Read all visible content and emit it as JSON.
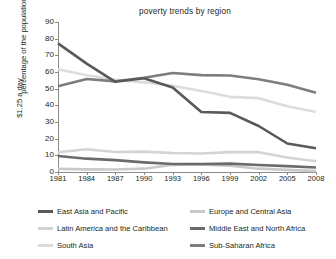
{
  "chart_data": {
    "type": "line",
    "title": "poverty trends by region",
    "xlabel": "",
    "ylabel": "percentage of the population living below $1.25 a day",
    "ylabel_line1": "percentage of the population living below",
    "ylabel_line2": "$1.25 a day",
    "x": [
      1981,
      1984,
      1987,
      1990,
      1993,
      1996,
      1999,
      2002,
      2005,
      2008
    ],
    "xticks": [
      "1981",
      "1984",
      "1987",
      "1990",
      "1993",
      "1996",
      "1999",
      "2002",
      "2005",
      "2008"
    ],
    "yticks": [
      "0",
      "10",
      "20",
      "30",
      "40",
      "50",
      "60",
      "70",
      "80",
      "90"
    ],
    "xlim": [
      1981,
      2008
    ],
    "ylim": [
      0,
      90
    ],
    "grid": false,
    "legend_position": "bottom",
    "series": [
      {
        "name": "East Asia and Pacific",
        "color": "#595959",
        "values": [
          77.2,
          65.0,
          54.1,
          56.2,
          50.7,
          36.0,
          35.5,
          27.6,
          17.1,
          14.3
        ]
      },
      {
        "name": "Europe and Central Asia",
        "color": "#c9c9c9",
        "values": [
          1.9,
          1.6,
          1.5,
          2.0,
          4.3,
          4.6,
          3.8,
          2.0,
          1.3,
          0.5
        ]
      },
      {
        "name": "Latin America and the Caribbean",
        "color": "#d4d4d4",
        "values": [
          11.9,
          13.6,
          12.0,
          12.2,
          11.4,
          11.1,
          11.9,
          11.9,
          8.7,
          6.5
        ]
      },
      {
        "name": "Middle East and North Africa",
        "color": "#6b6b6b",
        "values": [
          9.6,
          8.0,
          7.1,
          5.8,
          4.8,
          4.8,
          5.0,
          4.2,
          3.5,
          2.7
        ]
      },
      {
        "name": "South Asia",
        "color": "#dcdcdc",
        "values": [
          61.6,
          58.0,
          55.3,
          53.8,
          51.7,
          48.6,
          45.1,
          44.3,
          39.4,
          36.0
        ]
      },
      {
        "name": "Sub-Saharan Africa",
        "color": "#7d7d7d",
        "values": [
          51.5,
          55.8,
          54.4,
          56.5,
          59.4,
          58.1,
          57.9,
          55.7,
          52.3,
          47.5
        ]
      }
    ]
  },
  "legend": {
    "items": [
      {
        "label": "East Asia and Pacific",
        "color": "#595959"
      },
      {
        "label": "Europe and Central Asia",
        "color": "#c9c9c9"
      },
      {
        "label": "Latin America and the Caribbean",
        "color": "#d4d4d4"
      },
      {
        "label": "Middle East and North Africa",
        "color": "#6b6b6b"
      },
      {
        "label": "South Asia",
        "color": "#dcdcdc"
      },
      {
        "label": "Sub-Saharan Africa",
        "color": "#7d7d7d"
      }
    ]
  }
}
